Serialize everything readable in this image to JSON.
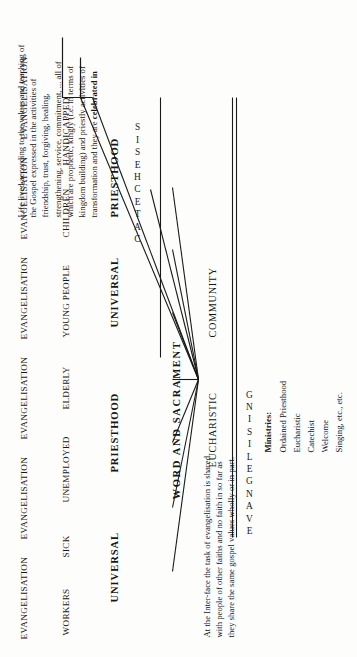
{
  "document": {
    "type": "scanned-diagram",
    "orientation": "rotated-90-ccw",
    "ink_color": "#16161a",
    "paper_color": "#fdfdfc"
  },
  "headers": [
    {
      "label": "EVANGELISATION"
    },
    {
      "label": "EVANGELISATION"
    },
    {
      "label": "EVANGELISATION"
    },
    {
      "label": "EVANGELISATION"
    },
    {
      "label": "EVANGELISATION"
    },
    {
      "label": "EVANGELISATION"
    }
  ],
  "groups": [
    {
      "label": "WORKERS"
    },
    {
      "label": "SICK"
    },
    {
      "label": "UNEMPLOYED"
    },
    {
      "label": "ELDERLY"
    },
    {
      "label": "YOUNG PEOPLE"
    },
    {
      "label": "CHILDREN"
    },
    {
      "label": "HANDICAPPED"
    }
  ],
  "roles": [
    {
      "label": "UNIVERSAL"
    },
    {
      "label": "PRIESTHOOD"
    },
    {
      "label": "UNIVERSAL"
    },
    {
      "label": "PRIESTHOOD"
    }
  ],
  "axis": {
    "word_and_sacrament": "WORD AND SACRAMENT",
    "eucharistic": "EUCHARISTIC",
    "community": "COMMUNITY"
  },
  "vertical_columns": [
    {
      "name": "evangelising",
      "text": "EVANGELISING"
    },
    {
      "name": "catechesis",
      "text": "CATECHESIS"
    }
  ],
  "notes": {
    "interface_note": "At the Inter-face the task of evangelisation is shared with people of other faiths and no faith in so far as they share the same gospel values wholly or in part.",
    "life_note_plain_a": "Life lived according to the values and teaching of the Gospel expressed in the activities of friendship, trust, forgiving, healing, strengthening, service, commitment, ... all of which are prophetic, kingly (i.e. in terms of kingdom building) and priestly activities of transformation and they are ",
    "life_note_bold": "celebrated in",
    "life_note_bold_lead": "Life lived according to the"
  },
  "ministries": {
    "heading": "Ministries:",
    "items": [
      "Ordained Priesthood",
      "Eucharistic",
      "Catechist",
      "Welcome",
      "Singing, etc., etc."
    ]
  }
}
